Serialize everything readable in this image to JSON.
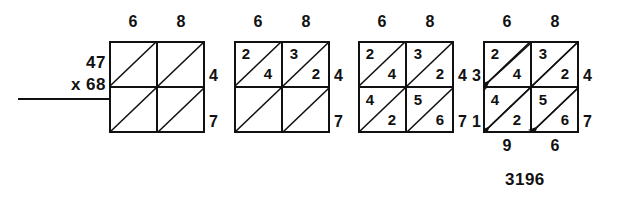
{
  "problem": {
    "multiplicand": "47",
    "multiplier": "x 68"
  },
  "answer": "3196",
  "grids": [
    {
      "name": "step-1-empty-lattice",
      "left": 109,
      "top": 41,
      "top_labels": [
        "6",
        "8"
      ],
      "right_labels": [
        "4",
        "7"
      ],
      "left_labels": [
        "",
        ""
      ],
      "bottom_labels": [
        "",
        ""
      ],
      "cells": [
        {
          "row": 0,
          "col": 0,
          "upper": "",
          "lower": ""
        },
        {
          "row": 0,
          "col": 1,
          "upper": "",
          "lower": ""
        },
        {
          "row": 1,
          "col": 0,
          "upper": "",
          "lower": ""
        },
        {
          "row": 1,
          "col": 1,
          "upper": "",
          "lower": ""
        }
      ],
      "arrows": false
    },
    {
      "name": "step-2-top-row-filled",
      "left": 234,
      "top": 41,
      "top_labels": [
        "6",
        "8"
      ],
      "right_labels": [
        "4",
        "7"
      ],
      "left_labels": [
        "",
        ""
      ],
      "bottom_labels": [
        "",
        ""
      ],
      "cells": [
        {
          "row": 0,
          "col": 0,
          "upper": "2",
          "lower": "4"
        },
        {
          "row": 0,
          "col": 1,
          "upper": "3",
          "lower": "2"
        },
        {
          "row": 1,
          "col": 0,
          "upper": "",
          "lower": ""
        },
        {
          "row": 1,
          "col": 1,
          "upper": "",
          "lower": ""
        }
      ],
      "arrows": false
    },
    {
      "name": "step-3-all-cells-filled",
      "left": 358,
      "top": 41,
      "top_labels": [
        "6",
        "8"
      ],
      "right_labels": [
        "4",
        "7"
      ],
      "left_labels": [
        "",
        ""
      ],
      "bottom_labels": [
        "",
        ""
      ],
      "cells": [
        {
          "row": 0,
          "col": 0,
          "upper": "2",
          "lower": "4"
        },
        {
          "row": 0,
          "col": 1,
          "upper": "3",
          "lower": "2"
        },
        {
          "row": 1,
          "col": 0,
          "upper": "4",
          "lower": "2"
        },
        {
          "row": 1,
          "col": 1,
          "upper": "5",
          "lower": "6"
        }
      ],
      "arrows": false
    },
    {
      "name": "step-4-diagonals-summed",
      "left": 483,
      "top": 41,
      "top_labels": [
        "6",
        "8"
      ],
      "right_labels": [
        "4",
        "7"
      ],
      "left_labels": [
        "3",
        "1"
      ],
      "bottom_labels": [
        "9",
        "6"
      ],
      "cells": [
        {
          "row": 0,
          "col": 0,
          "upper": "2",
          "lower": "4"
        },
        {
          "row": 0,
          "col": 1,
          "upper": "3",
          "lower": "2"
        },
        {
          "row": 1,
          "col": 0,
          "upper": "4",
          "lower": "2"
        },
        {
          "row": 1,
          "col": 1,
          "upper": "5",
          "lower": "6"
        }
      ],
      "arrows": true
    }
  ],
  "colors": {
    "ink": "#111111",
    "background": "#ffffff"
  }
}
